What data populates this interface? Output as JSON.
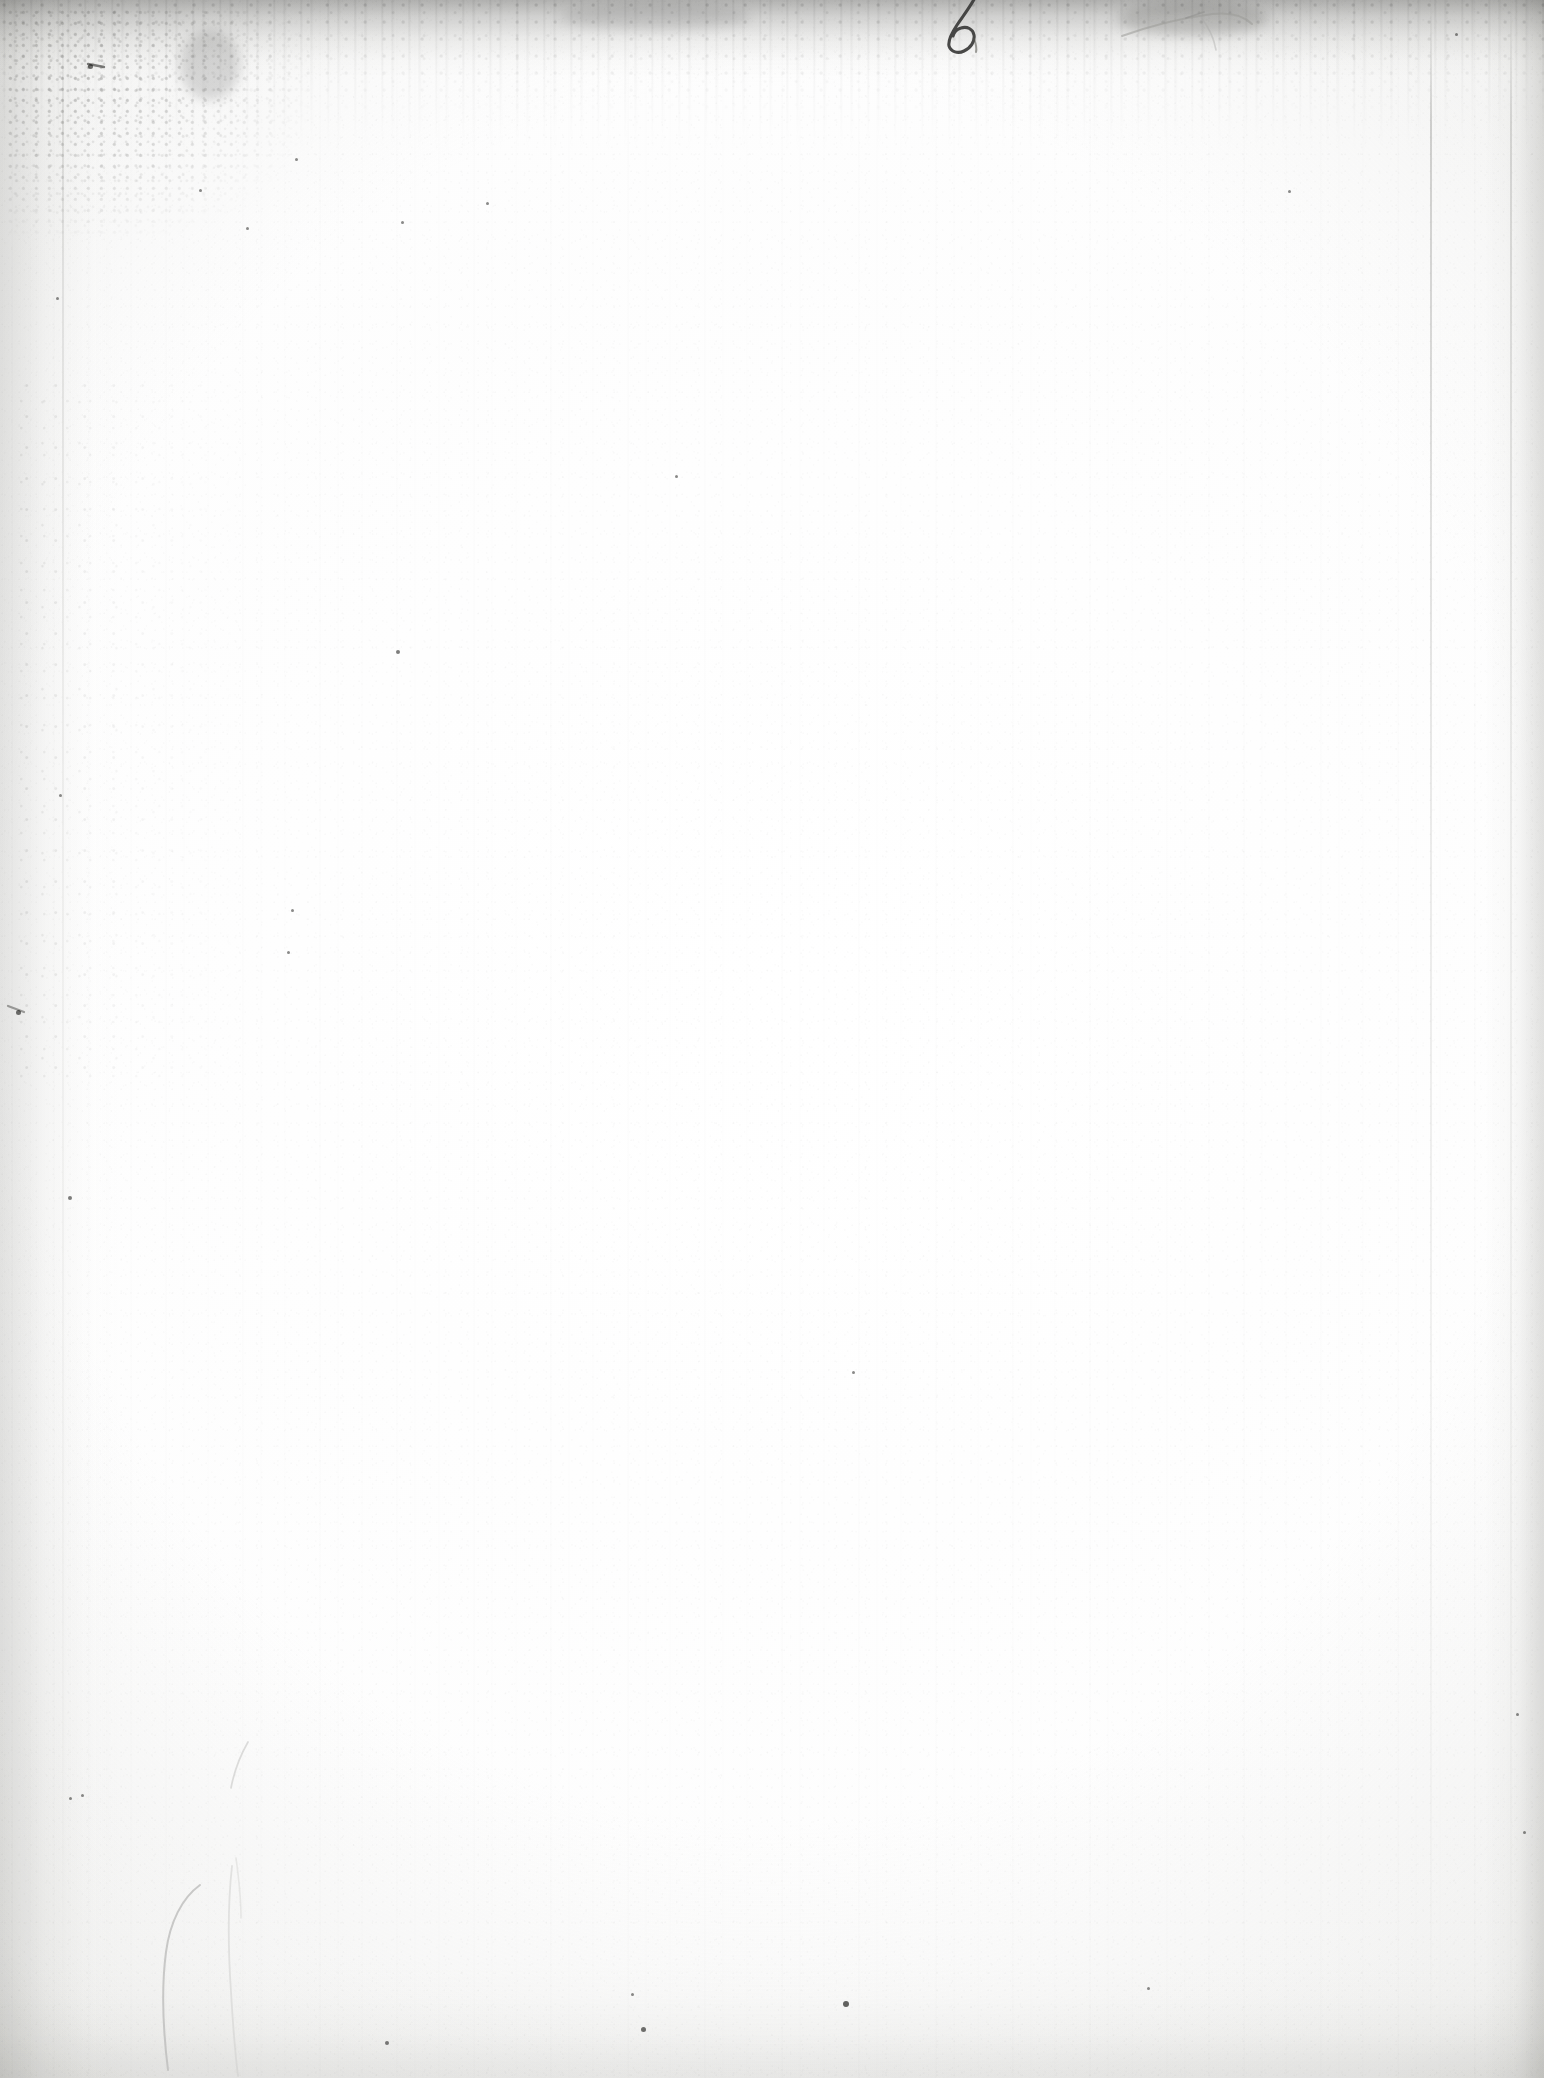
{
  "document": {
    "kind": "scanned-page",
    "page_state": "blank",
    "visible_text": "",
    "page_width": 1544,
    "page_height": 2078
  },
  "colors": {
    "paper": "#fdfdfd",
    "paper_shadow": "#f2f2f0",
    "edge_soil": "#969694",
    "ink_dark": "#3a3a38",
    "pencil_gray": "#b4b4b2",
    "speck": "#4e4e4c",
    "backdrop": "#8a8a8a"
  },
  "annotations": {
    "handwritten_numeral": {
      "label": "6",
      "description": "handwritten numeral in dark ink at the top edge, partially cropped",
      "x": 948,
      "y": 4,
      "width": 44,
      "height": 46
    },
    "pencil_swoosh": {
      "label": "",
      "description": "faint pencil stroke / smudge near the top right",
      "x": 1120,
      "y": 6,
      "width": 150,
      "height": 40
    },
    "crease_mark_bottom_left": {
      "label": "",
      "description": "faint curved crease or pencil line near the bottom left",
      "x": 140,
      "y": 1870,
      "width": 130,
      "height": 200
    },
    "crease_mark_mid_left": {
      "label": "",
      "description": "short faint stroke left of centre, lower half",
      "x": 225,
      "y": 1740,
      "width": 30,
      "height": 60
    }
  },
  "defects": {
    "top_edge_band": {
      "description": "dark soiled band across the top edge",
      "height": 78
    },
    "bottom_edge_band": {
      "description": "light gray dusty band across the bottom edge",
      "height": 120
    },
    "left_margin_shadow": {
      "description": "darker gradient along the left margin",
      "width": 120
    },
    "right_margin_shadow": {
      "description": "darker gradient along the right margin",
      "width": 60
    },
    "vertical_creases": [
      {
        "description": "faint vertical crease",
        "x": 1430
      },
      {
        "description": "faint vertical crease",
        "x": 1510
      },
      {
        "description": "faint vertical crease",
        "x": 62
      }
    ],
    "foxing_clusters": [
      {
        "description": "dense speckled foxing, top-left corner",
        "x": 8,
        "y": 10,
        "width": 300,
        "height": 230
      },
      {
        "description": "scattered foxing down the left margin",
        "x": 18,
        "y": 380,
        "width": 230,
        "height": 700
      },
      {
        "description": "speckling along the top band",
        "x": 0,
        "y": 0,
        "width": 1544,
        "height": 120
      }
    ],
    "specks": [
      {
        "x": 90,
        "y": 66,
        "size": 5
      },
      {
        "x": 57,
        "y": 298,
        "size": 3
      },
      {
        "x": 200,
        "y": 190,
        "size": 3
      },
      {
        "x": 247,
        "y": 228,
        "size": 3
      },
      {
        "x": 18,
        "y": 1012,
        "size": 5
      },
      {
        "x": 60,
        "y": 795,
        "size": 3
      },
      {
        "x": 70,
        "y": 1198,
        "size": 4
      },
      {
        "x": 402,
        "y": 222,
        "size": 3
      },
      {
        "x": 487,
        "y": 203,
        "size": 3
      },
      {
        "x": 398,
        "y": 652,
        "size": 4
      },
      {
        "x": 676,
        "y": 476,
        "size": 3
      },
      {
        "x": 846,
        "y": 2004,
        "size": 6
      },
      {
        "x": 643,
        "y": 2029,
        "size": 5
      },
      {
        "x": 387,
        "y": 2043,
        "size": 4
      },
      {
        "x": 632,
        "y": 1994,
        "size": 3
      },
      {
        "x": 1148,
        "y": 1988,
        "size": 3
      },
      {
        "x": 853,
        "y": 1372,
        "size": 3
      },
      {
        "x": 82,
        "y": 1795,
        "size": 3
      },
      {
        "x": 70,
        "y": 1798,
        "size": 3
      },
      {
        "x": 1456,
        "y": 34,
        "size": 3
      },
      {
        "x": 1517,
        "y": 1714,
        "size": 3
      },
      {
        "x": 1524,
        "y": 1832,
        "size": 3
      },
      {
        "x": 1289,
        "y": 191,
        "size": 3
      },
      {
        "x": 296,
        "y": 159,
        "size": 3
      },
      {
        "x": 292,
        "y": 910,
        "size": 3
      },
      {
        "x": 288,
        "y": 952,
        "size": 3
      }
    ]
  }
}
